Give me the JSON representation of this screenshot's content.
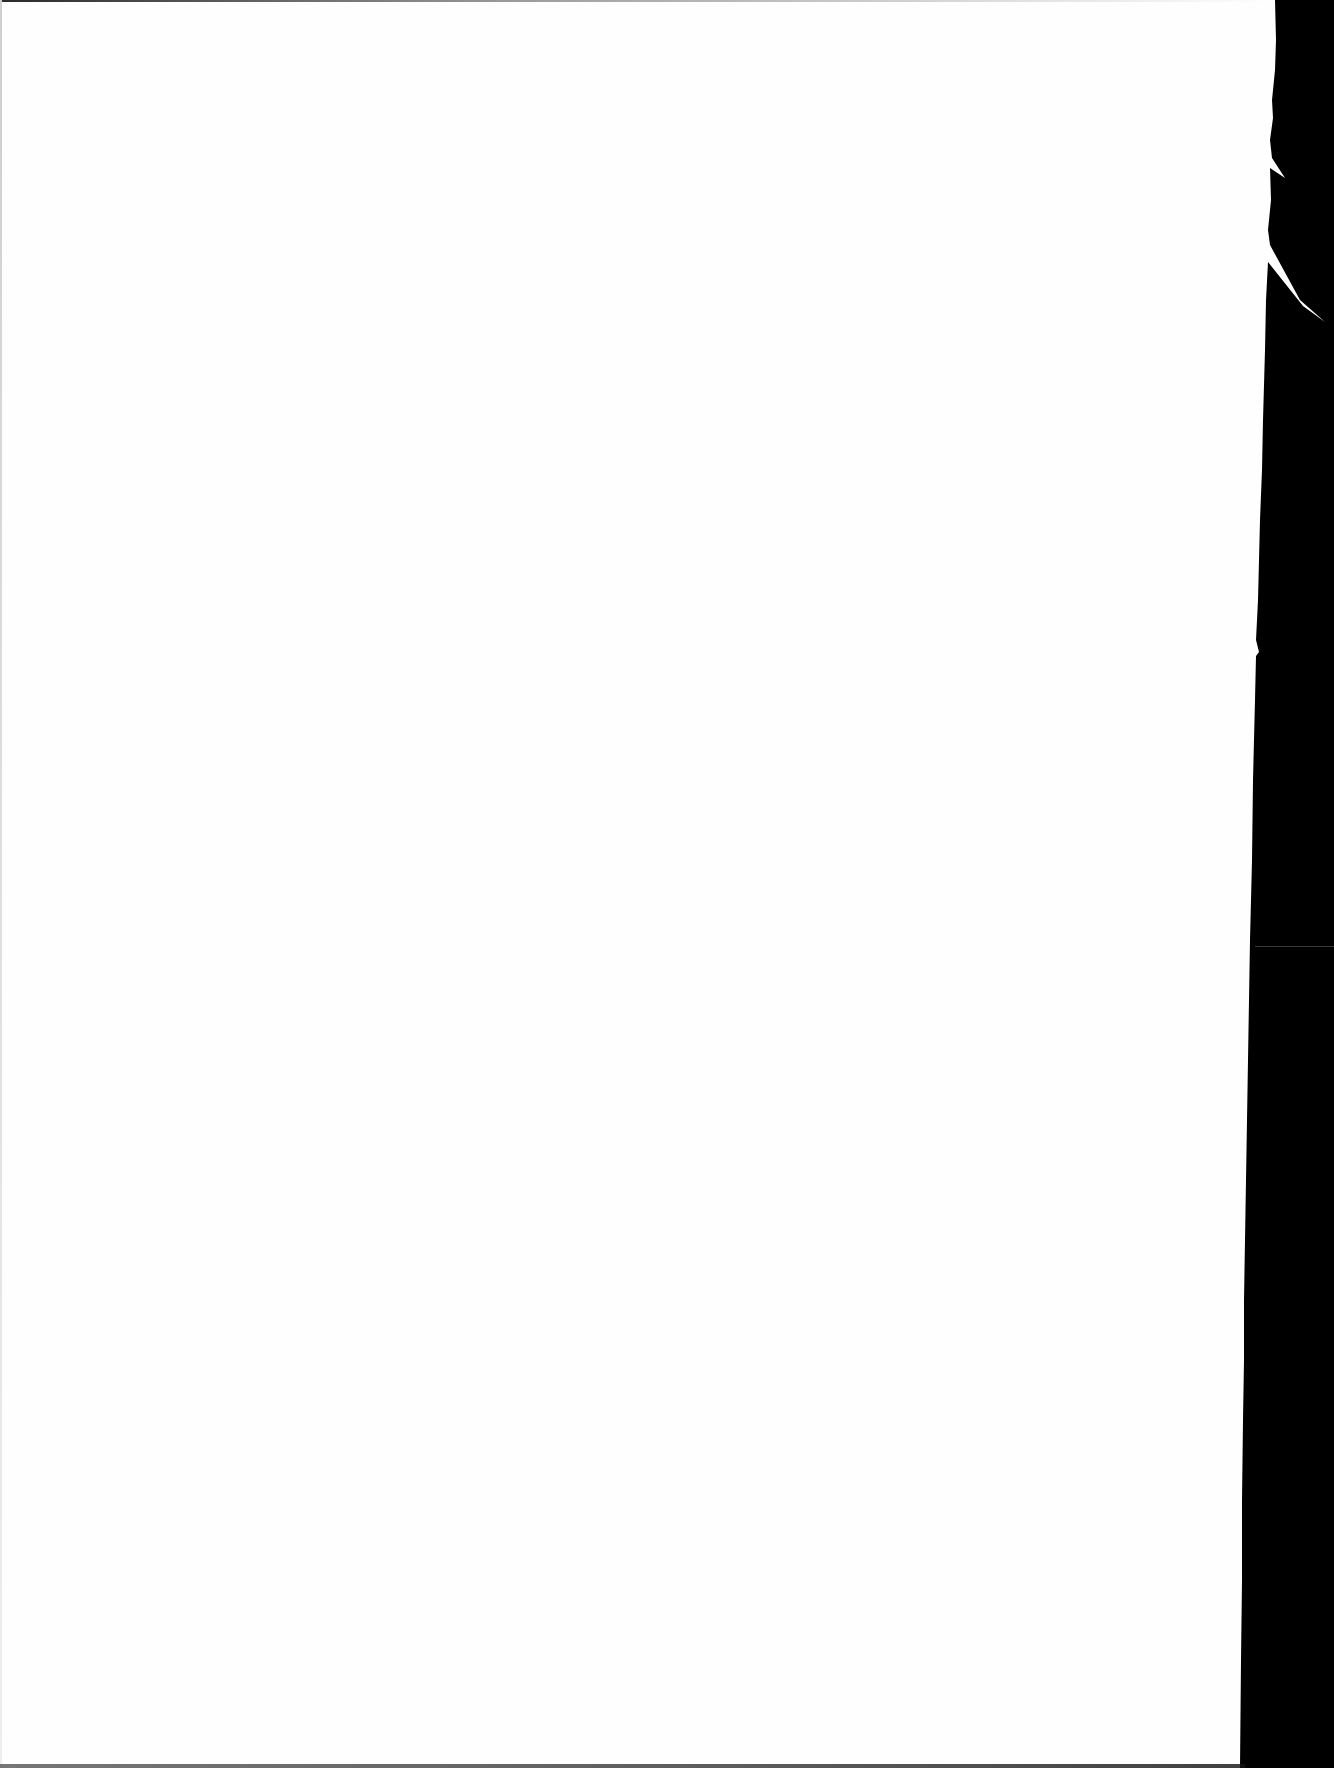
{
  "document": {
    "type": "scanned-page",
    "content": "",
    "is_blank": true
  },
  "colors": {
    "paper": "#fefefe",
    "scanner_background": "#000000"
  }
}
